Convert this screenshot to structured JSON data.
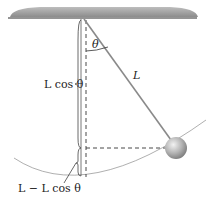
{
  "labels": {
    "theta": "θ",
    "length": "L",
    "vertical": "L cos θ",
    "height": "L − L cos θ"
  },
  "colors": {
    "ceiling": "#9a9a9a",
    "ceiling_edge": "#2a2a2a",
    "rod": "#8a8a8a",
    "line": "#333333",
    "arc": "#9a9a9a",
    "bob": "#b0b0b0"
  }
}
